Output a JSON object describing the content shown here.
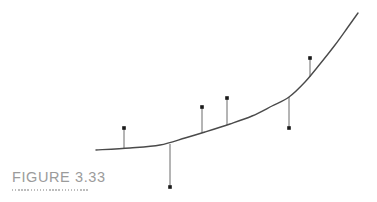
{
  "figure": {
    "caption": "FIGURE 3.33",
    "caption_color": "#9b9b9b",
    "rule_color": "#bdbdbd",
    "background": "#ffffff",
    "curve_color": "#4a4a4a",
    "stem_color": "#5a5a5a",
    "marker_color": "#1a1a1a"
  },
  "chart_data": {
    "type": "scatter",
    "title": "FIGURE 3.33",
    "xlabel": "",
    "ylabel": "",
    "grid": false,
    "legend": "none",
    "axes_visible": false,
    "xlim": [
      90,
      365
    ],
    "ylim": [
      195,
      8
    ],
    "fitted_curve": {
      "name": "fitted-curve",
      "style": "smooth-convex-increasing",
      "stroke": "#4a4a4a",
      "stroke_width": 1.4,
      "points": [
        {
          "x": 96,
          "y": 150
        },
        {
          "x": 130,
          "y": 148
        },
        {
          "x": 160,
          "y": 145
        },
        {
          "x": 185,
          "y": 138
        },
        {
          "x": 205,
          "y": 132
        },
        {
          "x": 230,
          "y": 124
        },
        {
          "x": 252,
          "y": 116
        },
        {
          "x": 272,
          "y": 106
        },
        {
          "x": 289,
          "y": 97
        },
        {
          "x": 305,
          "y": 82
        },
        {
          "x": 320,
          "y": 64
        },
        {
          "x": 335,
          "y": 45
        },
        {
          "x": 348,
          "y": 27
        },
        {
          "x": 358,
          "y": 13
        }
      ]
    },
    "observations": [
      {
        "label": "point-1",
        "x": 124,
        "y_observed": 128,
        "y_fitted": 148,
        "residual": 20,
        "side": "above"
      },
      {
        "label": "point-2",
        "x": 170,
        "y_observed": 187,
        "y_fitted": 144,
        "residual": -43,
        "side": "below"
      },
      {
        "label": "point-3",
        "x": 202,
        "y_observed": 107,
        "y_fitted": 133,
        "residual": 26,
        "side": "above"
      },
      {
        "label": "point-4",
        "x": 227,
        "y_observed": 98,
        "y_fitted": 125,
        "residual": 27,
        "side": "above"
      },
      {
        "label": "point-5",
        "x": 289,
        "y_observed": 128,
        "y_fitted": 97,
        "residual": -31,
        "side": "below"
      },
      {
        "label": "point-6",
        "x": 310,
        "y_observed": 58,
        "y_fitted": 77,
        "residual": 19,
        "side": "above"
      }
    ],
    "marker": {
      "shape": "square-dot",
      "size": 3.6,
      "color": "#1a1a1a"
    },
    "stem": {
      "stroke": "#5a5a5a",
      "stroke_width": 0.9
    }
  }
}
